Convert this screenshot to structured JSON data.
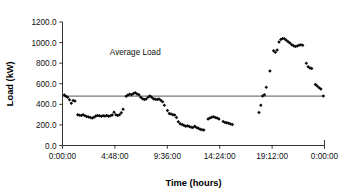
{
  "chart_data": {
    "type": "scatter",
    "title": "",
    "xlabel": "Time (hours)",
    "ylabel": "Load (kW)",
    "xlim": [
      0,
      86400
    ],
    "ylim": [
      0,
      1200
    ],
    "grid": false,
    "legend": "none",
    "y_ticks": [
      0,
      200,
      400,
      600,
      800,
      1000,
      1200
    ],
    "y_tick_labels": [
      "0.0",
      "200.0",
      "400.0",
      "600.0",
      "800.0",
      "1000.0",
      "1200.0"
    ],
    "x_ticks": [
      0,
      17280,
      34560,
      51840,
      69120,
      86400
    ],
    "x_tick_labels": [
      "0:00:00",
      "4:48:00",
      "9:36:00",
      "14:24:00",
      "19:12:00",
      "0:00:00"
    ],
    "annotations": [
      {
        "text": "Average Load",
        "x": 24000,
        "y": 880
      }
    ],
    "reference_lines": [
      {
        "name": "average-load",
        "orientation": "horizontal",
        "y": 480,
        "label": "Average Load"
      }
    ],
    "series": [
      {
        "name": "Load",
        "marker": "diamond",
        "color": "#0a0a0a",
        "points": [
          [
            600,
            490
          ],
          [
            1100,
            478
          ],
          [
            1700,
            470
          ],
          [
            2300,
            445
          ],
          [
            2900,
            410
          ],
          [
            3500,
            437
          ],
          [
            4100,
            432
          ],
          [
            5000,
            300
          ],
          [
            5600,
            295
          ],
          [
            6200,
            292
          ],
          [
            6800,
            298
          ],
          [
            7400,
            288
          ],
          [
            8000,
            282
          ],
          [
            8600,
            278
          ],
          [
            9200,
            272
          ],
          [
            9800,
            268
          ],
          [
            10400,
            274
          ],
          [
            11000,
            286
          ],
          [
            11600,
            292
          ],
          [
            12200,
            288
          ],
          [
            12800,
            285
          ],
          [
            13400,
            290
          ],
          [
            14000,
            287
          ],
          [
            14600,
            292
          ],
          [
            15200,
            283
          ],
          [
            15800,
            288
          ],
          [
            16400,
            296
          ],
          [
            17000,
            322
          ],
          [
            17600,
            300
          ],
          [
            18200,
            292
          ],
          [
            18800,
            300
          ],
          [
            19400,
            318
          ],
          [
            20000,
            352
          ],
          [
            21000,
            478
          ],
          [
            21600,
            490
          ],
          [
            22200,
            498
          ],
          [
            22800,
            494
          ],
          [
            23400,
            505
          ],
          [
            24000,
            512
          ],
          [
            24600,
            500
          ],
          [
            25200,
            492
          ],
          [
            25800,
            470
          ],
          [
            26400,
            455
          ],
          [
            27000,
            448
          ],
          [
            27600,
            452
          ],
          [
            28200,
            470
          ],
          [
            28800,
            482
          ],
          [
            29400,
            468
          ],
          [
            30000,
            455
          ],
          [
            30600,
            450
          ],
          [
            31200,
            448
          ],
          [
            31800,
            452
          ],
          [
            32400,
            440
          ],
          [
            33000,
            425
          ],
          [
            33600,
            390
          ],
          [
            34600,
            340
          ],
          [
            35200,
            310
          ],
          [
            35800,
            306
          ],
          [
            36400,
            300
          ],
          [
            37000,
            296
          ],
          [
            37600,
            272
          ],
          [
            38200,
            230
          ],
          [
            38800,
            212
          ],
          [
            39400,
            205
          ],
          [
            40000,
            196
          ],
          [
            40600,
            188
          ],
          [
            41200,
            192
          ],
          [
            41800,
            184
          ],
          [
            42400,
            178
          ],
          [
            43000,
            175
          ],
          [
            43600,
            188
          ],
          [
            44200,
            176
          ],
          [
            44800,
            168
          ],
          [
            45400,
            158
          ],
          [
            46000,
            152
          ],
          [
            46600,
            150
          ],
          [
            48000,
            258
          ],
          [
            48600,
            268
          ],
          [
            49200,
            275
          ],
          [
            49800,
            280
          ],
          [
            50400,
            272
          ],
          [
            51000,
            268
          ],
          [
            51600,
            258
          ],
          [
            53000,
            232
          ],
          [
            53600,
            224
          ],
          [
            54200,
            220
          ],
          [
            54800,
            216
          ],
          [
            55400,
            210
          ],
          [
            56000,
            205
          ],
          [
            64800,
            320
          ],
          [
            65400,
            392
          ],
          [
            66000,
            482
          ],
          [
            66600,
            492
          ],
          [
            67200,
            565
          ],
          [
            68400,
            725
          ],
          [
            69600,
            920
          ],
          [
            70200,
            905
          ],
          [
            70800,
            928
          ],
          [
            71400,
            1005
          ],
          [
            72000,
            1030
          ],
          [
            72600,
            1040
          ],
          [
            73200,
            1038
          ],
          [
            73800,
            1022
          ],
          [
            74400,
            1008
          ],
          [
            75000,
            995
          ],
          [
            75600,
            978
          ],
          [
            76200,
            970
          ],
          [
            76800,
            962
          ],
          [
            77400,
            968
          ],
          [
            78000,
            975
          ],
          [
            78600,
            980
          ],
          [
            79200,
            975
          ],
          [
            80400,
            800
          ],
          [
            81000,
            765
          ],
          [
            81600,
            752
          ],
          [
            82200,
            748
          ],
          [
            83400,
            592
          ],
          [
            84000,
            578
          ],
          [
            84600,
            560
          ],
          [
            85200,
            548
          ],
          [
            86000,
            480
          ]
        ]
      }
    ]
  }
}
